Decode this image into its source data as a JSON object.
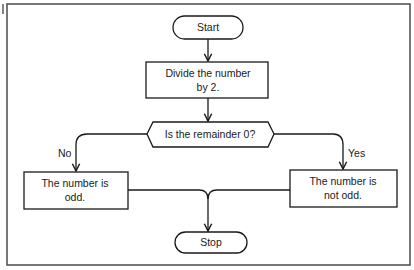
{
  "diagram": {
    "type": "flowchart",
    "nodes": {
      "start": {
        "shape": "terminal",
        "label": "Start"
      },
      "divide": {
        "shape": "process",
        "lines": [
          "Divide the number",
          "by 2."
        ]
      },
      "decision": {
        "shape": "decision",
        "label": "Is the remainder 0?"
      },
      "odd": {
        "shape": "process",
        "lines": [
          "The number is",
          "odd."
        ]
      },
      "not_odd": {
        "shape": "process",
        "lines": [
          "The number is",
          "not odd."
        ]
      },
      "stop": {
        "shape": "terminal",
        "label": "Stop"
      }
    },
    "edges": [
      {
        "from": "start",
        "to": "divide",
        "label": ""
      },
      {
        "from": "divide",
        "to": "decision",
        "label": ""
      },
      {
        "from": "decision",
        "to": "odd",
        "label": "No"
      },
      {
        "from": "decision",
        "to": "not_odd",
        "label": "Yes"
      },
      {
        "from": "odd",
        "to": "stop",
        "label": ""
      },
      {
        "from": "not_odd",
        "to": "stop",
        "label": ""
      }
    ],
    "edge_labels": {
      "no": "No",
      "yes": "Yes"
    }
  }
}
